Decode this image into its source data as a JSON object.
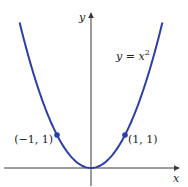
{
  "chart_data": {
    "type": "line",
    "title": "",
    "xlabel": "x",
    "ylabel": "y",
    "function_label": "y = x²",
    "function_label_base": "y = x",
    "function_label_exp": "2",
    "x": [
      -2.1,
      -1.8,
      -1.5,
      -1.2,
      -1,
      -0.8,
      -0.5,
      -0.25,
      0,
      0.25,
      0.5,
      0.8,
      1,
      1.2,
      1.5,
      1.8,
      2.1
    ],
    "series": [
      {
        "name": "y = x^2",
        "values": [
          4.41,
          3.24,
          2.25,
          1.44,
          1,
          0.64,
          0.25,
          0.0625,
          0,
          0.0625,
          0.25,
          0.64,
          1,
          1.44,
          2.25,
          3.24,
          4.41
        ]
      }
    ],
    "points": [
      {
        "x": -1,
        "y": 1,
        "label": "(−1, 1)"
      },
      {
        "x": 1,
        "y": 1,
        "label": "(1, 1)"
      }
    ],
    "xlim": [
      -2.6,
      2.8
    ],
    "ylim": [
      -0.55,
      4.6
    ],
    "grid": false,
    "colors": {
      "curve": "#2b3fa8",
      "axis": "#3a3a3a"
    }
  }
}
